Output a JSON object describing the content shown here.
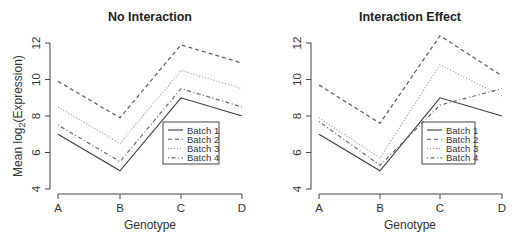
{
  "chart_data": [
    {
      "type": "line",
      "title": "No Interaction",
      "xlabel": "Genotype",
      "ylabel": "Mean log2(Expression)",
      "categories": [
        "A",
        "B",
        "C",
        "D"
      ],
      "ylim": [
        4,
        12
      ],
      "yticks": [
        4,
        6,
        8,
        10,
        12
      ],
      "grid": false,
      "legend_position": "right-center inside",
      "series": [
        {
          "name": "Batch 1",
          "style": "solid",
          "values": [
            7.0,
            5.0,
            9.0,
            8.0
          ]
        },
        {
          "name": "Batch 2",
          "style": "dashed",
          "values": [
            9.9,
            7.9,
            11.9,
            10.9
          ]
        },
        {
          "name": "Batch 3",
          "style": "dotted",
          "values": [
            8.5,
            6.5,
            10.5,
            9.5
          ]
        },
        {
          "name": "Batch 4",
          "style": "dotdash",
          "values": [
            7.5,
            5.5,
            9.5,
            8.5
          ]
        }
      ]
    },
    {
      "type": "line",
      "title": "Interaction Effect",
      "xlabel": "Genotype",
      "ylabel": "",
      "categories": [
        "A",
        "B",
        "C",
        "D"
      ],
      "ylim": [
        4,
        12
      ],
      "yticks": [
        4,
        6,
        8,
        10,
        12
      ],
      "grid": false,
      "legend_position": "right-center inside",
      "series": [
        {
          "name": "Batch 1",
          "style": "solid",
          "values": [
            7.0,
            5.0,
            9.0,
            8.0
          ]
        },
        {
          "name": "Batch 2",
          "style": "dashed",
          "values": [
            9.7,
            7.6,
            12.4,
            10.2
          ]
        },
        {
          "name": "Batch 3",
          "style": "dotted",
          "values": [
            7.9,
            5.7,
            10.8,
            9.1
          ]
        },
        {
          "name": "Batch 4",
          "style": "dotdash",
          "values": [
            7.7,
            5.3,
            8.6,
            9.5
          ]
        }
      ]
    }
  ],
  "panels": [
    {
      "title": "No Interaction",
      "xlabel": "Genotype",
      "ylabel_main": "Mean log",
      "ylabel_sub": "2",
      "ylabel_rest": "(Expression)",
      "legend": [
        "Batch 1",
        "Batch 2",
        "Batch 3",
        "Batch 4"
      ]
    },
    {
      "title": "Interaction Effect",
      "xlabel": "Genotype",
      "legend": [
        "Batch 1",
        "Batch 2",
        "Batch 3",
        "Batch 4"
      ]
    }
  ],
  "colors": {
    "Batch 1": "#3a3a3a",
    "Batch 2": "#5a5a5a",
    "Batch 3": "#9a9a9a",
    "Batch 4": "#6a6a6a",
    "axis": "#444444",
    "text": "#333333"
  }
}
